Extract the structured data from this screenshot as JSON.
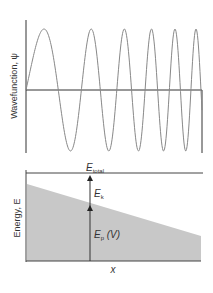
{
  "top_panel": {
    "ylabel": "Wavefunction, ψ",
    "curve_color": "#888888",
    "axis_color": "#333333"
  },
  "bottom_panel": {
    "ylabel": "Energy, E",
    "xlabel": "x",
    "total_label": "E",
    "total_sub": "total",
    "kinetic_label": "E",
    "kinetic_sub": "k",
    "potential_label": "E",
    "potential_sub": "p",
    "potential_suffix": " (V)",
    "fill_color": "#c8c8c8",
    "line_color": "#444444"
  }
}
